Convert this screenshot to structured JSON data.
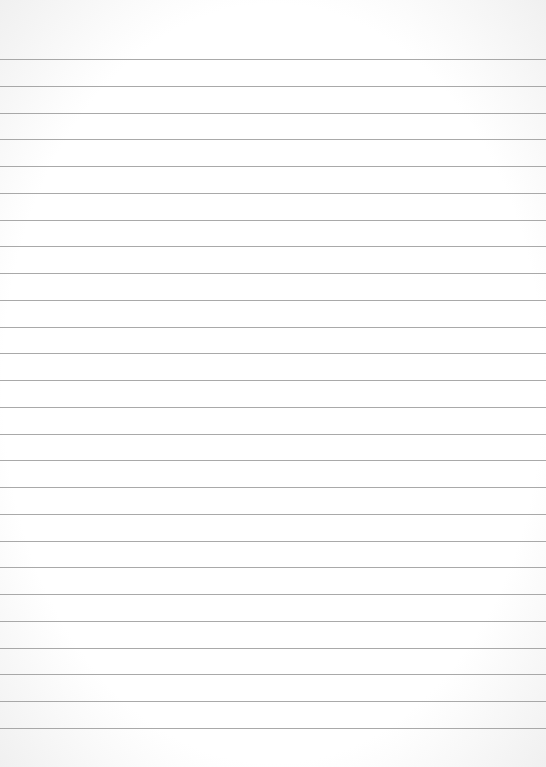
{
  "paper": {
    "type": "lined-paper",
    "background_color": "#ffffff",
    "line_color": "#9a9a9a",
    "first_line_y": 59,
    "line_spacing": 26.76,
    "line_count": 26
  }
}
